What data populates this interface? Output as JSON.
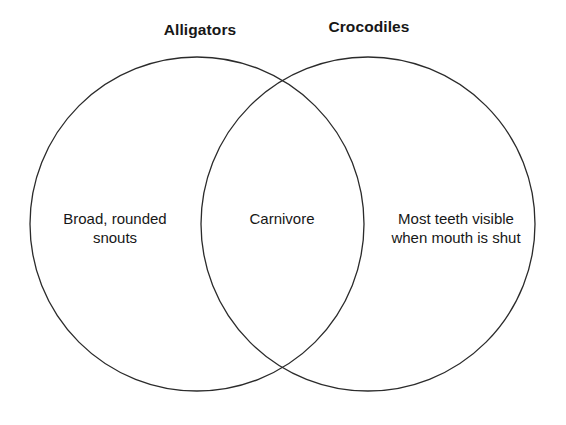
{
  "diagram": {
    "type": "venn",
    "sets": [
      {
        "id": "alligators",
        "title": "Alligators",
        "only_text": "Broad, rounded\nsnouts"
      },
      {
        "id": "crocodiles",
        "title": "Crocodiles",
        "only_text": "Most teeth visible\nwhen mouth is shut"
      }
    ],
    "intersection": {
      "text": "Carnivore"
    },
    "colors": {
      "background": "#ffffff",
      "outline": "#2b2b2b",
      "text": "#171717"
    },
    "geometry": {
      "left_circle": {
        "cx": 197,
        "cy": 224,
        "r": 167
      },
      "right_circle": {
        "cx": 368,
        "cy": 224,
        "r": 167
      }
    }
  }
}
